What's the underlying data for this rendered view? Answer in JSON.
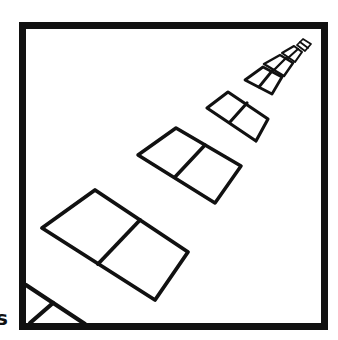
{
  "illustration": {
    "description": "Hand-drawn black-and-white frame containing a receding diagonal row of two-pane windows in perspective",
    "stroke_color": "#111111",
    "background_color": "#ffffff",
    "frame": {
      "x": 19,
      "y": 22,
      "width": 309,
      "height": 308,
      "border_width": 7
    },
    "windows": [
      {
        "left": [
          26,
          285
        ],
        "top": null,
        "right": null,
        "bottom": [
          85,
          324
        ],
        "divider": [
          [
            53,
            303
          ],
          [
            30,
            323
          ]
        ],
        "partial": true
      },
      {
        "left": [
          42,
          228
        ],
        "top": [
          95,
          190
        ],
        "right": [
          188,
          252
        ],
        "bottom": [
          155,
          300
        ],
        "divider": [
          [
            140,
            220
          ],
          [
            98,
            264
          ]
        ]
      },
      {
        "left": [
          138,
          155
        ],
        "top": [
          176,
          128
        ],
        "right": [
          241,
          166
        ],
        "bottom": [
          215,
          203
        ],
        "divider": [
          [
            205,
            145
          ],
          [
            175,
            177
          ]
        ]
      },
      {
        "left": [
          207,
          108
        ],
        "top": [
          228,
          92
        ],
        "right": [
          268,
          119
        ],
        "bottom": [
          256,
          141
        ],
        "divider": [
          [
            247,
            103
          ],
          [
            230,
            122
          ]
        ]
      },
      {
        "left": [
          245,
          80
        ],
        "top": [
          263,
          67
        ],
        "right": [
          282,
          77
        ],
        "bottom": [
          272,
          94
        ],
        "divider": [
          [
            272,
            71
          ],
          [
            259,
            87
          ]
        ]
      },
      {
        "left": [
          264,
          64
        ],
        "top": [
          280,
          55
        ],
        "right": [
          293,
          63
        ],
        "bottom": [
          284,
          76
        ],
        "divider": [
          [
            286,
            58
          ],
          [
            274,
            70
          ]
        ]
      },
      {
        "left": [
          282,
          53
        ],
        "top": [
          294,
          46
        ],
        "right": [
          302,
          52
        ],
        "bottom": [
          295,
          62
        ],
        "divider": [
          [
            298,
            49
          ],
          [
            288,
            58
          ]
        ]
      },
      {
        "left": [
          297,
          45
        ],
        "top": [
          303,
          39
        ],
        "right": [
          311,
          44
        ],
        "bottom": [
          305,
          51
        ],
        "divider": [
          [
            300,
            42
          ],
          [
            308,
            48
          ]
        ]
      }
    ]
  },
  "edge_text": "s"
}
